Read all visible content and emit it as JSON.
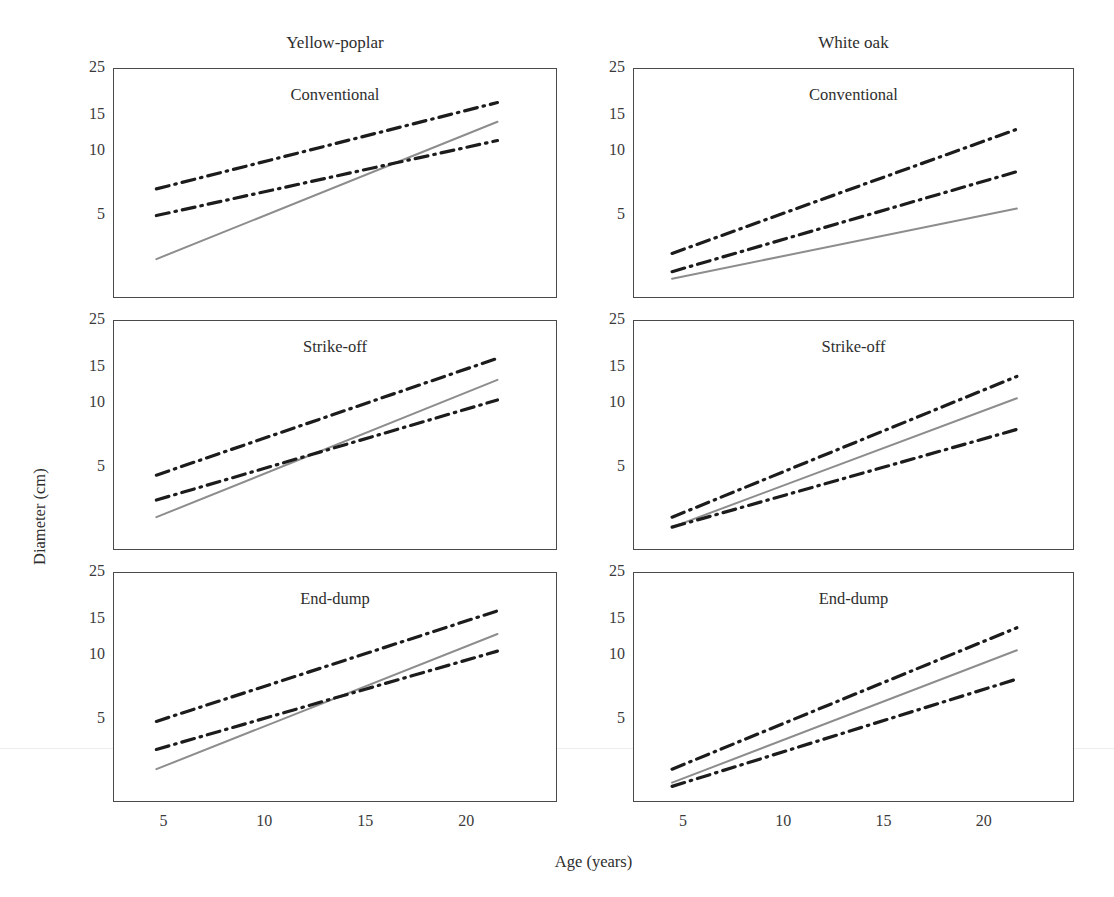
{
  "figure": {
    "column_titles": [
      "Yellow-poplar",
      "White oak"
    ],
    "axis_labels": {
      "y": "Diameter (cm)",
      "x": "Age (years)"
    }
  },
  "chart_data": {
    "type": "line",
    "title": "",
    "xlabel": "Age (years)",
    "ylabel": "Diameter (cm)",
    "xscale": "linear",
    "yscale": "log",
    "xlim": [
      2.5,
      24.5
    ],
    "ylim": [
      2.0,
      25.0
    ],
    "xticks": [
      5,
      10,
      15,
      20
    ],
    "xticklabels": [
      "5",
      "10",
      "15",
      "20"
    ],
    "yticks": [
      5,
      10,
      15,
      25
    ],
    "yticklabels": [
      "5",
      "10",
      "15",
      "25"
    ],
    "grid": false,
    "legend": "none",
    "series_styles": [
      {
        "name": "Upper bound",
        "style": "dash-dot",
        "color": "#1c1c1c",
        "width": 3.2
      },
      {
        "name": "Mean",
        "style": "solid",
        "color": "#8d8d8d",
        "width": 2.0
      },
      {
        "name": "Lower bound",
        "style": "dash-dot",
        "color": "#1c1c1c",
        "width": 3.2
      }
    ],
    "panels": [
      {
        "id": "yellow-poplar-conventional",
        "column": "Yellow-poplar",
        "row_title": "Conventional",
        "grid_position": [
          0,
          0
        ],
        "x": [
          4.6,
          21.5
        ],
        "series": [
          {
            "name": "Upper bound",
            "style": "dash-dot",
            "values": [
              6.7,
              17.3
            ]
          },
          {
            "name": "Mean",
            "style": "solid",
            "values": [
              3.1,
              14.0
            ]
          },
          {
            "name": "Lower bound",
            "style": "dash-dot",
            "values": [
              5.0,
              11.4
            ]
          }
        ]
      },
      {
        "id": "yellow-poplar-strike-off",
        "column": "Yellow-poplar",
        "row_title": "Strike-off",
        "grid_position": [
          1,
          0
        ],
        "x": [
          4.6,
          21.5
        ],
        "series": [
          {
            "name": "Upper bound",
            "style": "dash-dot",
            "values": [
              4.6,
              16.6
            ]
          },
          {
            "name": "Mean",
            "style": "solid",
            "values": [
              2.9,
              13.1
            ]
          },
          {
            "name": "Lower bound",
            "style": "dash-dot",
            "values": [
              3.5,
              10.5
            ]
          }
        ]
      },
      {
        "id": "yellow-poplar-end-dump",
        "column": "Yellow-poplar",
        "row_title": "End-dump",
        "grid_position": [
          2,
          0
        ],
        "x": [
          4.6,
          21.5
        ],
        "series": [
          {
            "name": "Upper bound",
            "style": "dash-dot",
            "values": [
              4.9,
              16.5
            ]
          },
          {
            "name": "Mean",
            "style": "solid",
            "values": [
              2.9,
              12.8
            ]
          },
          {
            "name": "Lower bound",
            "style": "dash-dot",
            "values": [
              3.6,
              10.6
            ]
          }
        ]
      },
      {
        "id": "white-oak-conventional",
        "column": "White oak",
        "row_title": "Conventional",
        "grid_position": [
          0,
          1
        ],
        "x": [
          4.4,
          21.6
        ],
        "series": [
          {
            "name": "Upper bound",
            "style": "dash-dot",
            "values": [
              3.3,
              12.9
            ]
          },
          {
            "name": "Mean",
            "style": "solid",
            "values": [
              2.5,
              5.4
            ]
          },
          {
            "name": "Lower bound",
            "style": "dash-dot",
            "values": [
              2.7,
              8.1
            ]
          }
        ]
      },
      {
        "id": "white-oak-strike-off",
        "column": "White oak",
        "row_title": "Strike-off",
        "grid_position": [
          1,
          1
        ],
        "x": [
          4.4,
          21.6
        ],
        "series": [
          {
            "name": "Upper bound",
            "style": "dash-dot",
            "values": [
              2.9,
              13.6
            ]
          },
          {
            "name": "Mean",
            "style": "solid",
            "values": [
              2.6,
              10.7
            ]
          },
          {
            "name": "Lower bound",
            "style": "dash-dot",
            "values": [
              2.6,
              7.6
            ]
          }
        ]
      },
      {
        "id": "white-oak-end-dump",
        "column": "White oak",
        "row_title": "End-dump",
        "grid_position": [
          2,
          1
        ],
        "x": [
          4.4,
          21.6
        ],
        "series": [
          {
            "name": "Upper bound",
            "style": "dash-dot",
            "values": [
              2.9,
              13.7
            ]
          },
          {
            "name": "Mean",
            "style": "solid",
            "values": [
              2.5,
              10.7
            ]
          },
          {
            "name": "Lower bound",
            "style": "dash-dot",
            "values": [
              2.4,
              7.8
            ]
          }
        ]
      }
    ]
  }
}
